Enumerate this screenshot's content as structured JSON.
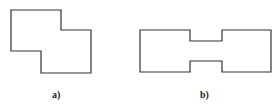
{
  "figures": [
    {
      "id": "a",
      "label": "a)",
      "shape": "stepped-polygon",
      "points": "11,10 61,10 61,30 91,30 91,73 41,73 41,51 11,51"
    },
    {
      "id": "b",
      "label": "b)",
      "shape": "dumbbell-polygon",
      "points": "140,30 190,30 190,41 222,41 222,30 271,30 271,72 222,72 222,61 190,61 190,72 140,72"
    }
  ],
  "colors": {
    "stroke": "#333333",
    "background": "#ffffff"
  }
}
